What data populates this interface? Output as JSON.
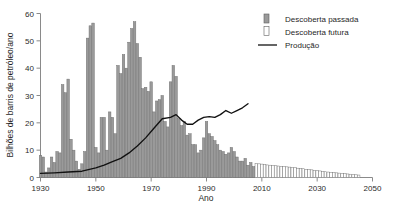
{
  "chart_data": {
    "type": "bar",
    "title": "",
    "xlabel": "Ano",
    "ylabel": "Bilhões de barris de petróleo/ano",
    "xlim": [
      1930,
      2050
    ],
    "ylim": [
      0,
      60
    ],
    "yticks": [
      0,
      10,
      20,
      30,
      40,
      50,
      60
    ],
    "xticks": [
      1930,
      1950,
      1970,
      1990,
      2010,
      2030,
      2050
    ],
    "grid": false,
    "legend_position": "top-right",
    "legend": [
      {
        "label": "Descoberta passada",
        "marker": "filled-bar",
        "color": "#9a9a9a"
      },
      {
        "label": "Descoberta futura",
        "marker": "hollow-bar",
        "color": "#ffffff"
      },
      {
        "label": "Produção",
        "marker": "line",
        "color": "#111111"
      }
    ],
    "series": [
      {
        "name": "Descoberta passada",
        "type": "bar",
        "color": "#9a9a9a",
        "x": [
          1930,
          1931,
          1932,
          1933,
          1934,
          1935,
          1936,
          1937,
          1938,
          1939,
          1940,
          1941,
          1942,
          1943,
          1944,
          1945,
          1946,
          1947,
          1948,
          1949,
          1950,
          1951,
          1952,
          1953,
          1954,
          1955,
          1956,
          1957,
          1958,
          1959,
          1960,
          1961,
          1962,
          1963,
          1964,
          1965,
          1966,
          1967,
          1968,
          1969,
          1970,
          1971,
          1972,
          1973,
          1974,
          1975,
          1976,
          1977,
          1978,
          1979,
          1980,
          1981,
          1982,
          1983,
          1984,
          1985,
          1986,
          1987,
          1988,
          1989,
          1990,
          1991,
          1992,
          1993,
          1994,
          1995,
          1996,
          1997,
          1998,
          1999,
          2000,
          2001,
          2002,
          2003,
          2004,
          2005,
          2006,
          2007
        ],
        "values": [
          8.0,
          7.5,
          2.0,
          3.5,
          7.5,
          5.5,
          9.5,
          9.0,
          34.0,
          31.0,
          36.0,
          14.0,
          10.0,
          6.0,
          3.0,
          5.0,
          9.5,
          51.0,
          55.5,
          56.5,
          11.0,
          9.0,
          22.0,
          22.0,
          10.0,
          24.0,
          22.0,
          16.0,
          41.0,
          38.0,
          45.0,
          40.0,
          49.5,
          54.5,
          57.0,
          49.0,
          44.0,
          32.5,
          33.0,
          31.5,
          35.0,
          24.0,
          28.0,
          28.5,
          30.0,
          20.5,
          18.5,
          35.0,
          41.0,
          37.0,
          21.5,
          19.0,
          20.5,
          15.5,
          16.0,
          12.0,
          12.0,
          9.0,
          10.0,
          14.5,
          20.5,
          16.0,
          15.0,
          13.5,
          12.0,
          10.0,
          9.5,
          8.5,
          9.0,
          11.0,
          9.5,
          7.5,
          6.0,
          6.0,
          7.0,
          4.5,
          5.5,
          4.0
        ]
      },
      {
        "name": "Descoberta futura",
        "type": "bar",
        "color": "#ffffff",
        "x": [
          2008,
          2009,
          2010,
          2011,
          2012,
          2013,
          2014,
          2015,
          2016,
          2017,
          2018,
          2019,
          2020,
          2021,
          2022,
          2023,
          2024,
          2025,
          2026,
          2027,
          2028,
          2029,
          2030,
          2031,
          2032,
          2033,
          2034,
          2035,
          2036,
          2037,
          2038,
          2039,
          2040,
          2041,
          2042,
          2043,
          2044,
          2045
        ],
        "values": [
          5.2,
          5.0,
          4.9,
          4.7,
          4.6,
          4.5,
          4.4,
          4.3,
          4.2,
          4.1,
          4.0,
          3.9,
          3.8,
          3.7,
          3.6,
          3.4,
          3.3,
          3.2,
          3.0,
          2.9,
          2.8,
          2.6,
          2.5,
          2.4,
          2.2,
          2.1,
          2.0,
          1.9,
          1.8,
          1.7,
          1.6,
          1.5,
          1.4,
          1.3,
          1.2,
          1.1,
          1.0,
          0.9
        ]
      },
      {
        "name": "Produção",
        "type": "line",
        "color": "#111111",
        "x": [
          1930,
          1935,
          1940,
          1945,
          1950,
          1953,
          1956,
          1959,
          1962,
          1965,
          1968,
          1971,
          1974,
          1977,
          1979,
          1981,
          1983,
          1985,
          1987,
          1989,
          1991,
          1993,
          1995,
          1997,
          1999,
          2001,
          2003,
          2005
        ],
        "values": [
          1.5,
          1.7,
          2.0,
          2.3,
          3.5,
          4.5,
          5.8,
          7.0,
          9.0,
          11.5,
          14.5,
          18.0,
          21.5,
          22.0,
          23.0,
          21.0,
          19.5,
          19.5,
          21.0,
          22.0,
          22.3,
          22.0,
          23.0,
          24.5,
          23.5,
          24.5,
          25.5,
          27.0
        ]
      }
    ]
  }
}
